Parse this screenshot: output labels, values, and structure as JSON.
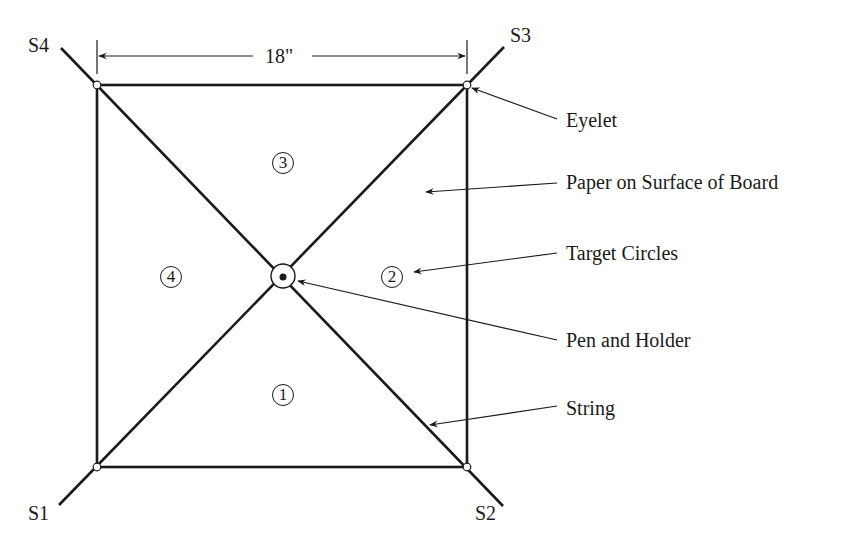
{
  "diagram": {
    "corner_labels": {
      "s4": "S4",
      "s3": "S3",
      "s1": "S1",
      "s2": "S2"
    },
    "dimension": {
      "label": "18\""
    },
    "regions": {
      "r1": "1",
      "r2": "2",
      "r3": "3",
      "r4": "4"
    },
    "callouts": {
      "eyelet": "Eyelet",
      "paper": "Paper on Surface of Board",
      "target": "Target Circles",
      "pen": "Pen and Holder",
      "string": "String"
    },
    "colors": {
      "line": "#1a1a1a",
      "background": "#ffffff"
    }
  }
}
